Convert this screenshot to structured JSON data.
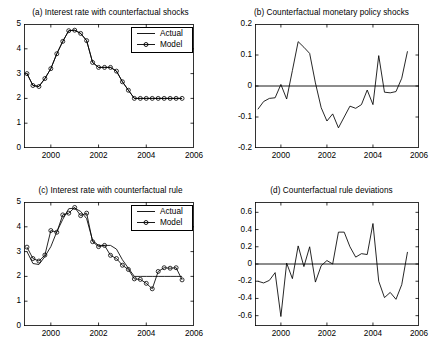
{
  "figure": {
    "background": "#ffffff",
    "line_color": "#000000",
    "axis_color": "#000000"
  },
  "legend": {
    "actual_label": "Actual",
    "model_label": "Model"
  },
  "chart_data": [
    {
      "id": "panel-a",
      "type": "line",
      "title": "(a) Interest rate with counterfactual shocks",
      "xlabel": "",
      "ylabel": "",
      "xlim": [
        1998.875,
        2006.0
      ],
      "ylim": [
        0,
        5
      ],
      "xticks": [
        2000,
        2002,
        2004,
        2006
      ],
      "xticklabels": [
        "2000",
        "2002",
        "2004",
        "2006"
      ],
      "yticks": [
        0,
        1,
        2,
        3,
        4,
        5
      ],
      "yticklabels": [
        "0",
        "1",
        "2",
        "3",
        "4",
        "5"
      ],
      "grid": false,
      "legend_position": "top-right",
      "x": [
        1999.0,
        1999.25,
        1999.5,
        1999.75,
        2000.0,
        2000.25,
        2000.5,
        2000.75,
        2001.0,
        2001.25,
        2001.5,
        2001.75,
        2002.0,
        2002.25,
        2002.5,
        2002.75,
        2003.0,
        2003.25,
        2003.5,
        2003.75,
        2004.0,
        2004.25,
        2004.5,
        2004.75,
        2005.0,
        2005.25,
        2005.5
      ],
      "series": [
        {
          "name": "Actual",
          "style": "line",
          "values": [
            3.0,
            2.52,
            2.48,
            2.8,
            3.2,
            3.8,
            4.3,
            4.73,
            4.75,
            4.62,
            4.33,
            3.45,
            3.25,
            3.25,
            3.25,
            3.1,
            2.67,
            2.33,
            2.0,
            2.0,
            2.0,
            2.0,
            2.0,
            2.0,
            2.0,
            2.0,
            2.0
          ]
        },
        {
          "name": "Model",
          "style": "line-marker",
          "marker": "circle",
          "values": [
            3.0,
            2.52,
            2.48,
            2.8,
            3.2,
            3.8,
            4.3,
            4.73,
            4.75,
            4.62,
            4.33,
            3.45,
            3.25,
            3.25,
            3.25,
            3.1,
            2.67,
            2.33,
            2.0,
            2.0,
            2.0,
            2.0,
            2.0,
            2.0,
            2.0,
            2.0,
            2.0
          ]
        }
      ]
    },
    {
      "id": "panel-b",
      "type": "line",
      "title": "(b) Counterfactual monetary policy shocks",
      "xlabel": "",
      "ylabel": "",
      "xlim": [
        1998.875,
        2006.0
      ],
      "ylim": [
        -0.2,
        0.2
      ],
      "xticks": [
        2000,
        2002,
        2004,
        2006
      ],
      "xticklabels": [
        "2000",
        "2002",
        "2004",
        "2006"
      ],
      "yticks": [
        -0.2,
        -0.1,
        0,
        0.1,
        0.2
      ],
      "yticklabels": [
        "-0.2",
        "-0.1",
        "0",
        "0.1",
        "0.2"
      ],
      "grid": false,
      "zero_line": true,
      "x": [
        1999.0,
        1999.25,
        1999.5,
        1999.75,
        2000.0,
        2000.25,
        2000.5,
        2000.75,
        2001.0,
        2001.25,
        2001.5,
        2001.75,
        2002.0,
        2002.25,
        2002.5,
        2002.75,
        2003.0,
        2003.25,
        2003.5,
        2003.75,
        2004.0,
        2004.25,
        2004.5,
        2004.75,
        2005.0,
        2005.25,
        2005.5
      ],
      "series": [
        {
          "name": "shock",
          "style": "line",
          "values": [
            -0.075,
            -0.05,
            -0.04,
            -0.038,
            0.005,
            -0.042,
            0.05,
            0.143,
            0.125,
            0.105,
            0.01,
            -0.07,
            -0.113,
            -0.09,
            -0.135,
            -0.1,
            -0.065,
            -0.072,
            -0.06,
            -0.013,
            -0.06,
            0.098,
            -0.02,
            -0.022,
            -0.018,
            0.025,
            0.112
          ]
        }
      ]
    },
    {
      "id": "panel-c",
      "type": "line",
      "title": "(c) Interest rate with counterfactual rule",
      "xlabel": "",
      "ylabel": "",
      "xlim": [
        1998.875,
        2006.0
      ],
      "ylim": [
        0,
        5
      ],
      "xticks": [
        2000,
        2002,
        2004,
        2006
      ],
      "xticklabels": [
        "2000",
        "2002",
        "2004",
        "2006"
      ],
      "yticks": [
        0,
        1,
        2,
        3,
        4,
        5
      ],
      "yticklabels": [
        "0",
        "1",
        "2",
        "3",
        "4",
        "5"
      ],
      "grid": false,
      "legend_position": "top-right",
      "x": [
        1999.0,
        1999.25,
        1999.5,
        1999.75,
        2000.0,
        2000.25,
        2000.5,
        2000.75,
        2001.0,
        2001.25,
        2001.5,
        2001.75,
        2002.0,
        2002.25,
        2002.5,
        2002.75,
        2003.0,
        2003.25,
        2003.5,
        2003.75,
        2004.0,
        2004.25,
        2004.5,
        2004.75,
        2005.0,
        2005.25,
        2005.5
      ],
      "series": [
        {
          "name": "Actual",
          "style": "line",
          "values": [
            3.0,
            2.52,
            2.48,
            2.8,
            3.2,
            3.8,
            4.3,
            4.73,
            4.75,
            4.62,
            4.33,
            3.45,
            3.25,
            3.25,
            3.25,
            3.1,
            2.67,
            2.33,
            2.0,
            2.0,
            2.0,
            2.0,
            2.0,
            2.0,
            2.0,
            2.0,
            2.0
          ]
        },
        {
          "name": "Model",
          "style": "line-marker",
          "marker": "circle",
          "values": [
            3.18,
            2.72,
            2.62,
            2.86,
            3.85,
            3.78,
            4.48,
            4.55,
            4.78,
            4.45,
            4.55,
            3.4,
            3.2,
            3.25,
            2.85,
            2.72,
            2.45,
            2.28,
            1.9,
            1.88,
            1.72,
            1.5,
            2.2,
            2.35,
            2.33,
            2.35,
            1.86
          ]
        }
      ]
    },
    {
      "id": "panel-d",
      "type": "line",
      "title": "(d) Counterfactual rule deviations",
      "xlabel": "",
      "ylabel": "",
      "xlim": [
        1998.875,
        2006.0
      ],
      "ylim": [
        -0.72,
        0.72
      ],
      "xticks": [
        2000,
        2002,
        2004,
        2006
      ],
      "xticklabels": [
        "2000",
        "2002",
        "2004",
        "2006"
      ],
      "yticks": [
        -0.6,
        -0.4,
        -0.2,
        0,
        0.2,
        0.4,
        0.6
      ],
      "yticklabels": [
        "-0.6",
        "-0.4",
        "-0.2",
        "0",
        "0.2",
        "0.4",
        "0.6"
      ],
      "grid": false,
      "zero_line": true,
      "x": [
        1999.0,
        1999.25,
        1999.5,
        1999.75,
        2000.0,
        2000.25,
        2000.5,
        2000.75,
        2001.0,
        2001.25,
        2001.5,
        2001.75,
        2002.0,
        2002.25,
        2002.5,
        2002.75,
        2003.0,
        2003.25,
        2003.5,
        2003.75,
        2004.0,
        2004.25,
        2004.5,
        2004.75,
        2005.0,
        2005.25,
        2005.5
      ],
      "series": [
        {
          "name": "deviation",
          "style": "line",
          "values": [
            -0.2,
            -0.22,
            -0.19,
            -0.1,
            -0.61,
            0.01,
            -0.17,
            0.21,
            -0.03,
            0.2,
            -0.21,
            -0.02,
            0.04,
            0.0,
            0.37,
            0.37,
            0.2,
            0.08,
            0.12,
            0.11,
            0.47,
            -0.2,
            -0.39,
            -0.33,
            -0.41,
            -0.24,
            0.14
          ]
        }
      ]
    }
  ]
}
